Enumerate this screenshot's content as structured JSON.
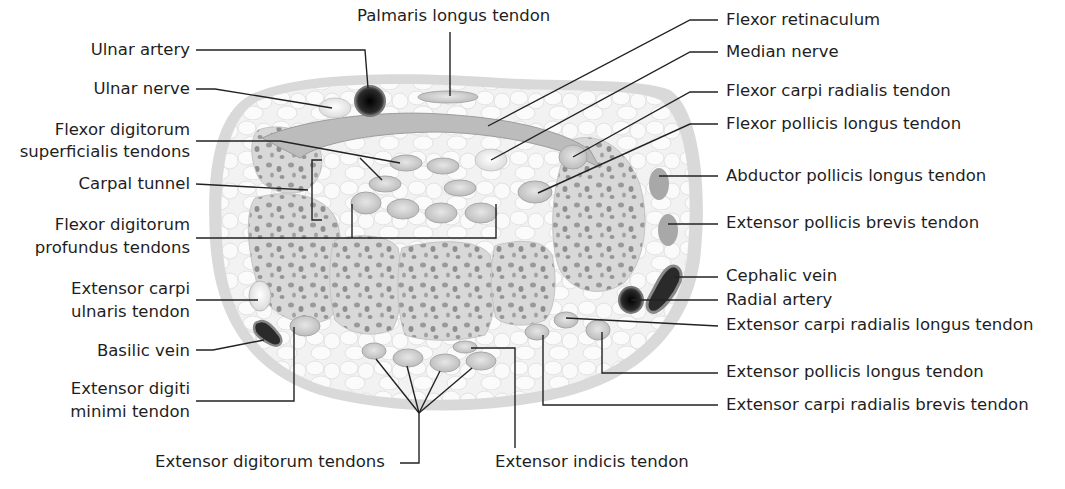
{
  "figure": {
    "colors": {
      "skin": "#d9d9d9",
      "fat": "#efefef",
      "bone": "#d6d6d6",
      "bone_spot": "#8f8f8f",
      "tendon": "#cfcfcf",
      "nerve": "#f4f4f4",
      "artery": "#1a1a1a",
      "leader": "#222222"
    }
  },
  "labels": {
    "left": {
      "ulnar_artery": "Ulnar artery",
      "ulnar_nerve": "Ulnar nerve",
      "fds_1": "Flexor digitorum",
      "fds_2": "superficialis tendons",
      "carpal_tunnel": "Carpal tunnel",
      "fdp_1": "Flexor digitorum",
      "fdp_2": "profundus tendons",
      "ecu_1": "Extensor carpi",
      "ecu_2": "ulnaris tendon",
      "basilic_vein": "Basilic vein",
      "edm_1": "Extensor digiti",
      "edm_2": "minimi tendon"
    },
    "top": {
      "palmaris_longus": "Palmaris longus tendon"
    },
    "right": {
      "flexor_retinaculum": "Flexor retinaculum",
      "median_nerve": "Median nerve",
      "fcr": "Flexor carpi radialis tendon",
      "fpl": "Flexor pollicis longus tendon",
      "apl": "Abductor pollicis longus tendon",
      "epb": "Extensor pollicis brevis tendon",
      "cephalic_vein": "Cephalic vein",
      "radial_artery": "Radial artery",
      "ecrl": "Extensor carpi radialis longus tendon",
      "epl": "Extensor pollicis longus tendon",
      "ecrb": "Extensor carpi radialis brevis tendon"
    },
    "bottom": {
      "extensor_digitorum": "Extensor digitorum tendons",
      "extensor_indicis": "Extensor indicis tendon"
    }
  }
}
